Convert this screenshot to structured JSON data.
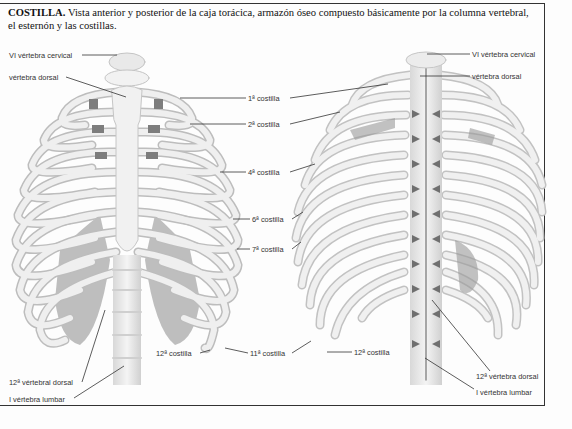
{
  "caption": {
    "term": "COSTILLA.",
    "text": "Vista anterior y posterior de la caja torácica, armazón óseo compuesto básicamente por la columna vertebral, el esternón y las costillas."
  },
  "anterior_view": {
    "labels": {
      "vi_cervical": "VI vértebra cervical",
      "dorsal": "vértebra dorsal",
      "costilla_1": "1ª costilla",
      "costilla_2": "2ª costilla",
      "costilla_4": "4ª costilla",
      "costilla_6": "6ª costilla",
      "costilla_7": "7ª costilla",
      "costilla_12": "12ª costilla",
      "costilla_11": "11ª costilla",
      "dorsal_12": "12ª vértebral dorsal",
      "lumbar_1": "I vértebra lumbar"
    }
  },
  "posterior_view": {
    "labels": {
      "vi_cervical": "VI vértebra cervical",
      "dorsal": "vértebra dorsal",
      "costilla_12": "12ª costilla",
      "dorsal_12": "12ª vértebra dorsal",
      "lumbar_1": "I vértebra lumbar"
    }
  },
  "colors": {
    "bone": "#ececec",
    "bone_edge": "#b9b9b9",
    "cartilage": "#8c8c8c",
    "leader": "#333333"
  }
}
